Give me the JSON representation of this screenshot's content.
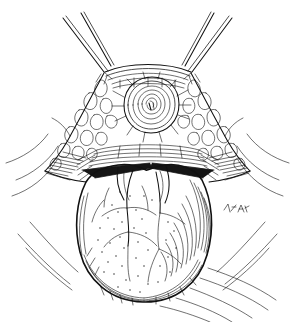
{
  "figure": {
    "title": "Perineal region with prolapsed mass",
    "medium": "pen-and-ink line drawing",
    "palette": {
      "background": "#ffffff",
      "ink": "#111111",
      "shadow_fill": "#151515"
    },
    "canvas": {
      "width": 295,
      "height": 322
    },
    "artist_signature": {
      "present": true,
      "legible": false,
      "text": "",
      "position": {
        "x": 232,
        "y": 212
      }
    },
    "parts": [
      {
        "name": "left-thigh",
        "label": "Left thigh",
        "interactable": false
      },
      {
        "name": "right-thigh",
        "label": "Right thigh",
        "interactable": false
      },
      {
        "name": "perineal-body-outline",
        "label": "Perineal body outline",
        "interactable": false
      },
      {
        "name": "anus-rosette",
        "label": "Anus with radiating folds",
        "interactable": false
      },
      {
        "name": "left-buttock-texture",
        "label": "Left buttock skin texture",
        "interactable": false
      },
      {
        "name": "right-buttock-texture",
        "label": "Right buttock skin texture",
        "interactable": false
      },
      {
        "name": "hatched-band",
        "label": "Hatched transitional band",
        "interactable": false
      },
      {
        "name": "retractor-wedge-left",
        "label": "Left retractor wedge",
        "interactable": false
      },
      {
        "name": "retractor-wedge-right",
        "label": "Right retractor wedge",
        "interactable": false
      },
      {
        "name": "prolapsed-mass",
        "label": "Prolapsed rounded mass",
        "interactable": false
      },
      {
        "name": "mass-vessel-lines",
        "label": "Surface vessel branches",
        "interactable": false
      },
      {
        "name": "mass-stipple-shading",
        "label": "Stippled shading",
        "interactable": false
      },
      {
        "name": "contour-lines-left",
        "label": "Left sweeping contour lines",
        "interactable": false
      },
      {
        "name": "contour-lines-right",
        "label": "Right sweeping contour lines",
        "interactable": false
      },
      {
        "name": "contour-lines-bottom",
        "label": "Lower sweeping contour lines",
        "interactable": false
      }
    ]
  }
}
